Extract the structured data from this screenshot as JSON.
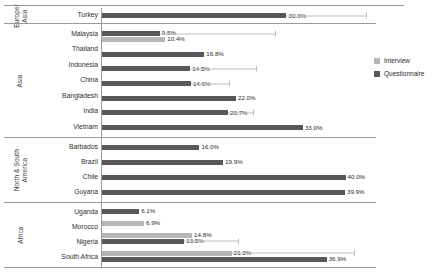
{
  "chart_data": {
    "type": "bar",
    "orientation": "horizontal",
    "title": "",
    "xlabel": "",
    "ylabel": "",
    "xlim": [
      0,
      45
    ],
    "grid": false,
    "legend_position": "right",
    "value_suffix": "%",
    "series": [
      {
        "name": "Interview",
        "color": "#b6b6b6"
      },
      {
        "name": "Questionnaire",
        "color": "#585858"
      }
    ],
    "groups": [
      {
        "region": "Europe/\nAsia",
        "region_plain": "Europe/Asia",
        "categories": [
          {
            "label": "Turkey",
            "bars": [
              {
                "series": "Questionnaire",
                "value": 30.3,
                "label": "30.3%",
                "whisker_to": 43.5
              }
            ]
          }
        ]
      },
      {
        "region": "Asia",
        "region_plain": "Asia",
        "categories": [
          {
            "label": "Malaysia",
            "bars": [
              {
                "series": "Questionnaire",
                "value": 9.5,
                "label": "9.5%",
                "whisker_to": 28.5
              },
              {
                "series": "Interview",
                "value": 10.4,
                "label": "10.4%",
                "whisker_to": 0
              }
            ]
          },
          {
            "label": "Thailand",
            "bars": [
              {
                "series": "Questionnaire",
                "value": 16.8,
                "label": "16.8%",
                "whisker_to": 0
              }
            ]
          },
          {
            "label": "Indonesia",
            "bars": [
              {
                "series": "Questionnaire",
                "value": 14.5,
                "label": "14.5%",
                "whisker_to": 25.5
              }
            ]
          },
          {
            "label": "China",
            "bars": [
              {
                "series": "Questionnaire",
                "value": 14.6,
                "label": "14.6%",
                "whisker_to": 21.0
              }
            ]
          },
          {
            "label": "Bangladesh",
            "bars": [
              {
                "series": "Questionnaire",
                "value": 22.0,
                "label": "22.0%",
                "whisker_to": 0
              }
            ]
          },
          {
            "label": "India",
            "bars": [
              {
                "series": "Questionnaire",
                "value": 20.7,
                "label": "20.7%",
                "whisker_to": 25.0
              }
            ]
          },
          {
            "label": "Vietnam",
            "bars": [
              {
                "series": "Questionnaire",
                "value": 33.0,
                "label": "33.0%",
                "whisker_to": 0
              }
            ]
          }
        ]
      },
      {
        "region": "North & South\nAmerica",
        "region_plain": "North & South America",
        "categories": [
          {
            "label": "Barbados",
            "bars": [
              {
                "series": "Questionnaire",
                "value": 16.0,
                "label": "16.0%",
                "whisker_to": 0
              }
            ]
          },
          {
            "label": "Brazil",
            "bars": [
              {
                "series": "Questionnaire",
                "value": 19.9,
                "label": "19.9%",
                "whisker_to": 0
              }
            ]
          },
          {
            "label": "Chile",
            "bars": [
              {
                "series": "Questionnaire",
                "value": 40.0,
                "label": "40.0%",
                "whisker_to": 0
              }
            ]
          },
          {
            "label": "Guyana",
            "bars": [
              {
                "series": "Questionnaire",
                "value": 39.9,
                "label": "39.9%",
                "whisker_to": 0
              }
            ]
          }
        ]
      },
      {
        "region": "Africa",
        "region_plain": "Africa",
        "categories": [
          {
            "label": "Uganda",
            "bars": [
              {
                "series": "Questionnaire",
                "value": 6.1,
                "label": "6.1%",
                "whisker_to": 0
              }
            ]
          },
          {
            "label": "Morocco",
            "bars": [
              {
                "series": "Interview",
                "value": 6.9,
                "label": "6.9%",
                "whisker_to": 0
              }
            ]
          },
          {
            "label": "Nigeria",
            "bars": [
              {
                "series": "Interview",
                "value": 14.8,
                "label": "14.8%",
                "whisker_to": 0
              },
              {
                "series": "Questionnaire",
                "value": 13.5,
                "label": "13.5%",
                "whisker_to": 22.5
              }
            ]
          },
          {
            "label": "South Africa",
            "bars": [
              {
                "series": "Interview",
                "value": 21.3,
                "label": "21.3%",
                "whisker_to": 41.5
              },
              {
                "series": "Questionnaire",
                "value": 36.9,
                "label": "36.9%",
                "whisker_to": 0
              }
            ]
          }
        ]
      }
    ]
  },
  "legend": {
    "items": [
      {
        "label": "Interview",
        "key": "interview"
      },
      {
        "label": "Questionnaire",
        "key": "questionnaire"
      }
    ]
  }
}
